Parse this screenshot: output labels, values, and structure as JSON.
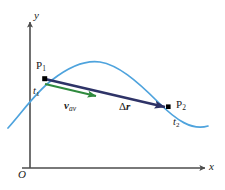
{
  "figure": {
    "kind": "physics-vector-diagram",
    "background_color": "#ffffff",
    "axes": {
      "y_label": "y",
      "x_label": "x",
      "origin_label": "O",
      "axis_color": "#4d4d4d"
    },
    "trajectory": {
      "name": "particle-path",
      "color": "#4ea3dd",
      "description": "curved path"
    },
    "points": [
      {
        "id": "P1",
        "label": "P",
        "subscript": "1",
        "time_label": "t",
        "time_subscript": "1",
        "marker_color": "#000000"
      },
      {
        "id": "P2",
        "label": "P",
        "subscript": "2",
        "time_label": "t",
        "time_subscript": "2",
        "marker_color": "#000000"
      }
    ],
    "vectors": [
      {
        "id": "v-av",
        "symbol": "v",
        "subscript": "av",
        "color": "#2f8a3e",
        "description": "average velocity vector"
      },
      {
        "id": "delta-r",
        "symbol": "Δr",
        "delta": "Δ",
        "base": "r",
        "color": "#2e3367",
        "description": "displacement vector"
      }
    ]
  }
}
